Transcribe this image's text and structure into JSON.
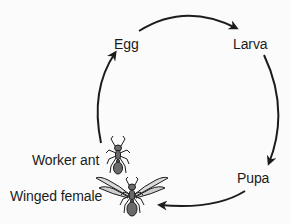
{
  "diagram": {
    "type": "cycle",
    "stages": [
      {
        "id": "egg",
        "label": "Egg"
      },
      {
        "id": "larva",
        "label": "Larva"
      },
      {
        "id": "pupa",
        "label": "Pupa"
      },
      {
        "id": "winged_female",
        "label": "Winged female"
      },
      {
        "id": "worker_ant",
        "label": "Worker ant"
      }
    ],
    "arrows": [
      {
        "from": "egg",
        "to": "larva"
      },
      {
        "from": "larva",
        "to": "pupa"
      },
      {
        "from": "pupa",
        "to": "winged_female"
      },
      {
        "from": "worker_ant",
        "to": "egg"
      }
    ],
    "illustrations": [
      {
        "id": "worker_ant",
        "icon": "ant-icon"
      },
      {
        "id": "winged_female",
        "icon": "winged-ant-icon"
      }
    ],
    "colors": {
      "background": "#fbfbfb",
      "ink": "#1c1c1c",
      "ant_body": "#6a6a6a"
    }
  }
}
